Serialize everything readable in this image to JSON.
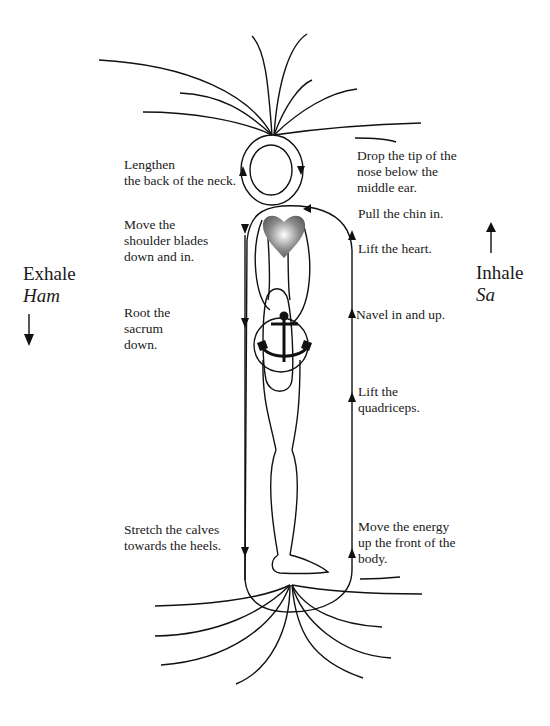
{
  "diagram": {
    "left_side": {
      "title": "Exhale",
      "mantra": "Ham",
      "arrow_direction": "down",
      "instructions": [
        "Lengthen\nthe back of the neck.",
        "Move the\nshoulder blades\ndown and in.",
        "Root the\nsacrum\ndown.",
        "Stretch the calves\ntowards the heels."
      ]
    },
    "right_side": {
      "title": "Inhale",
      "mantra": "Sa",
      "arrow_direction": "up",
      "instructions": [
        "Drop the tip of the\nnose below the\nmiddle ear.",
        "Pull the chin in.",
        "Lift the heart.",
        "Navel in and up.",
        "Lift the\nquadriceps.",
        "Move the energy\nup the front of the\nbody."
      ]
    },
    "figure": {
      "description": "side-view human figure with energy loop",
      "icons": [
        "heart-icon",
        "anchor-icon"
      ],
      "heart_color": "#808080",
      "line_color": "#111111"
    }
  }
}
